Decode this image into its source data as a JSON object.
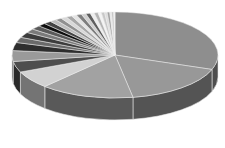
{
  "chart_data": {
    "type": "pie",
    "style": "3d",
    "title": "",
    "labels_shown": false,
    "legend": "none",
    "start_angle_deg": 90,
    "direction": "clockwise",
    "slices": [
      {
        "name": "slice-1",
        "value": 30.0,
        "color": "#8e8e8e"
      },
      {
        "name": "slice-2",
        "value": 16.5,
        "color": "#989898"
      },
      {
        "name": "slice-3",
        "value": 14.5,
        "color": "#a2a2a2"
      },
      {
        "name": "slice-4",
        "value": 6.5,
        "color": "#d2d2d2"
      },
      {
        "name": "slice-5",
        "value": 4.0,
        "color": "#4e4e4e"
      },
      {
        "name": "slice-6",
        "value": 4.0,
        "color": "#9a9a9a"
      },
      {
        "name": "slice-7",
        "value": 3.0,
        "color": "#2e2e2e"
      },
      {
        "name": "slice-8",
        "value": 2.0,
        "color": "#6a6a6a"
      },
      {
        "name": "slice-9",
        "value": 2.0,
        "color": "#3c3c3c"
      },
      {
        "name": "slice-10",
        "value": 1.5,
        "color": "#7a7a7a"
      },
      {
        "name": "slice-11",
        "value": 1.5,
        "color": "#5a5a5a"
      },
      {
        "name": "slice-12",
        "value": 1.2,
        "color": "#0e0e0e"
      },
      {
        "name": "slice-13",
        "value": 1.2,
        "color": "#444444"
      },
      {
        "name": "slice-14",
        "value": 1.0,
        "color": "#bdbdbd"
      },
      {
        "name": "slice-15",
        "value": 1.0,
        "color": "#909090"
      },
      {
        "name": "slice-16",
        "value": 0.9,
        "color": "#d8d8d8"
      },
      {
        "name": "slice-17",
        "value": 0.9,
        "color": "#a8a8a8"
      },
      {
        "name": "slice-18",
        "value": 0.8,
        "color": "#e4e4e4"
      },
      {
        "name": "slice-19",
        "value": 0.8,
        "color": "#7e7e7e"
      },
      {
        "name": "slice-20",
        "value": 0.7,
        "color": "#cfcfcf"
      },
      {
        "name": "slice-21",
        "value": 0.7,
        "color": "#5e5e5e"
      },
      {
        "name": "slice-22",
        "value": 0.6,
        "color": "#eeeeee"
      },
      {
        "name": "slice-23",
        "value": 0.6,
        "color": "#b4b4b4"
      },
      {
        "name": "slice-24",
        "value": 0.5,
        "color": "#f4f4f4"
      },
      {
        "name": "slice-25",
        "value": 0.5,
        "color": "#c8c8c8"
      },
      {
        "name": "slice-26",
        "value": 0.4,
        "color": "#dddddd"
      },
      {
        "name": "slice-27",
        "value": 0.4,
        "color": "#a0a0a0"
      },
      {
        "name": "slice-28",
        "value": 0.3,
        "color": "#e8e8e8"
      },
      {
        "name": "slice-29",
        "value": 0.3,
        "color": "#c0c0c0"
      },
      {
        "name": "slice-30",
        "value": 0.2,
        "color": "#f0f0f0"
      }
    ]
  }
}
